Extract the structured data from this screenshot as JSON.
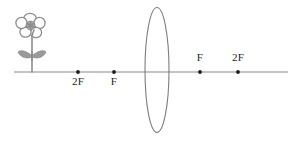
{
  "diagram": {
    "canvas": {
      "width": 298,
      "height": 142,
      "background": "#ffffff"
    },
    "colors": {
      "axis": "#8a8a8a",
      "lens": "#7d7d7d",
      "dot": "#1b1b1b",
      "label_text": "#1f1f1f",
      "flower": "#8d8d8d",
      "leaf_fill": "#9a9a9a",
      "flower_center": "#a8a8a8"
    },
    "optical_axis": {
      "label": "optical-axis",
      "y": 72,
      "x_start": 14,
      "x_end": 288
    },
    "lens": {
      "label": "converging-lens",
      "center_x": 157,
      "center_y": 70,
      "rx": 12,
      "ry": 62.5
    },
    "object": {
      "label": "flower-object",
      "base_x": 32,
      "base_y": 72,
      "top_y": 14,
      "petal_count": 5
    },
    "markers": [
      {
        "name": "left-2f",
        "text": "2F",
        "x": 78,
        "label_y": 76,
        "side": "below"
      },
      {
        "name": "left-f",
        "text": "F",
        "x": 114,
        "label_y": 76,
        "side": "below"
      },
      {
        "name": "right-f",
        "text": "F",
        "x": 200,
        "label_y": 52,
        "side": "above"
      },
      {
        "name": "right-2f",
        "text": "2F",
        "x": 238,
        "label_y": 52,
        "side": "above"
      }
    ]
  }
}
